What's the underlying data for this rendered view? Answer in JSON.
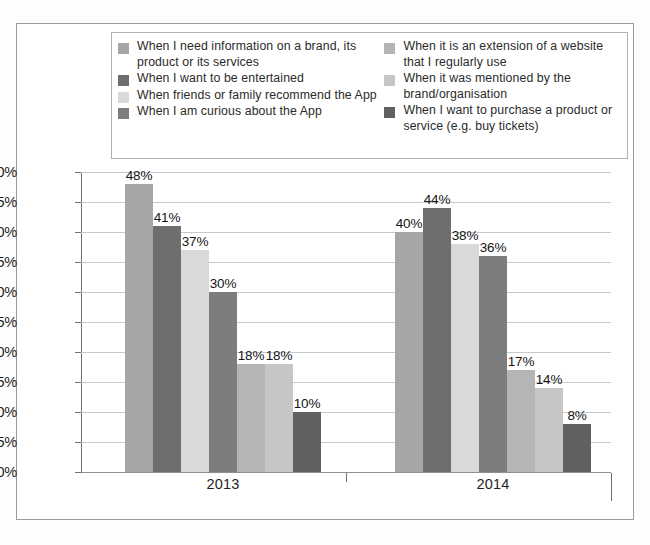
{
  "chart_data": {
    "type": "bar",
    "title": "",
    "subtitle": "",
    "xlabel": "",
    "ylabel": "",
    "categories": [
      "2013",
      "2014"
    ],
    "ylim": [
      0,
      50
    ],
    "ytick_labels": [
      "50%",
      "45%",
      "40%",
      "35%",
      "30%",
      "25%",
      "20%",
      "15%",
      "10%",
      "5%",
      "0%"
    ],
    "ytick_values": [
      50,
      45,
      40,
      35,
      30,
      25,
      20,
      15,
      10,
      5,
      0
    ],
    "grid": true,
    "legend_position": "top",
    "series": [
      {
        "name": "When I need information on a brand, its product or its services",
        "color": "#a6a6a6",
        "values": [
          48,
          40
        ],
        "labels": [
          "48%",
          "40%"
        ]
      },
      {
        "name": "When I want to be entertained",
        "color": "#6e6e6e",
        "values": [
          41,
          44
        ],
        "labels": [
          "41%",
          "44%"
        ]
      },
      {
        "name": "When friends or family recommend the App",
        "color": "#d9d9d9",
        "values": [
          37,
          38
        ],
        "labels": [
          "37%",
          "38%"
        ]
      },
      {
        "name": "When I am curious about the App",
        "color": "#7d7d7d",
        "values": [
          30,
          36
        ],
        "labels": [
          "30%",
          "36%"
        ]
      },
      {
        "name": "When it is an extension of a website that I regularly use",
        "color": "#b5b5b5",
        "values": [
          18,
          17
        ],
        "labels": [
          "18%",
          "17%"
        ]
      },
      {
        "name": "When it was mentioned by the brand/organisation",
        "color": "#c6c6c6",
        "values": [
          18,
          14
        ],
        "labels": [
          "18%",
          "14%"
        ]
      },
      {
        "name": "When I want to purchase a product or service (e.g. buy tickets)",
        "color": "#616161",
        "values": [
          10,
          8
        ],
        "labels": [
          "10%",
          "8%"
        ]
      }
    ]
  },
  "legend": {
    "column_1": [
      {
        "label": "When I need information on a brand, its product or its services",
        "color": "#a6a6a6"
      },
      {
        "label": "When I want to be entertained",
        "color": "#6e6e6e"
      },
      {
        "label": "When friends or family recommend the App",
        "color": "#d9d9d9"
      },
      {
        "label": "When I am curious about the App",
        "color": "#7d7d7d"
      }
    ],
    "column_2": [
      {
        "label": "When it is an extension of a website that I regularly use",
        "color": "#b5b5b5"
      },
      {
        "label": "When it was mentioned by the brand/organisation",
        "color": "#c6c6c6"
      },
      {
        "label": "When I want to purchase a product or service (e.g. buy tickets)",
        "color": "#616161"
      }
    ]
  }
}
